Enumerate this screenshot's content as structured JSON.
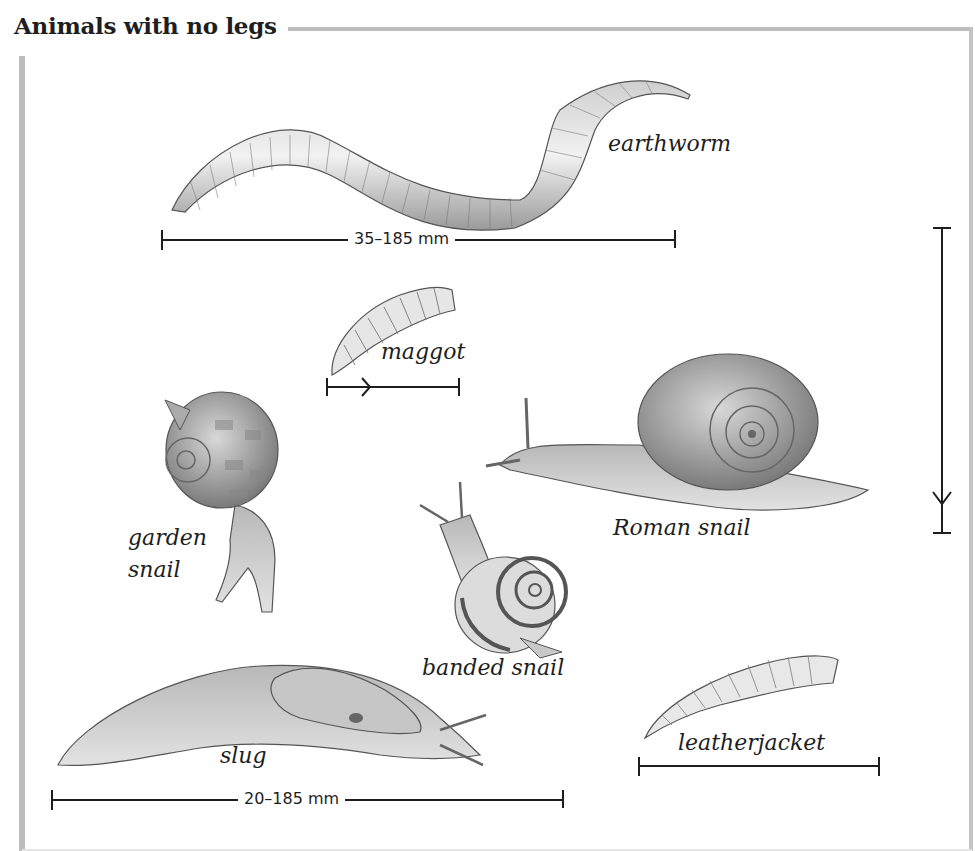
{
  "title": "Animals with no legs",
  "animals": [
    {
      "name": "earthworm",
      "label": "earthworm"
    },
    {
      "name": "maggot",
      "label": "maggot"
    },
    {
      "name": "garden-snail",
      "label_line1": "garden",
      "label_line2": "snail"
    },
    {
      "name": "roman-snail",
      "label": "Roman snail"
    },
    {
      "name": "banded-snail",
      "label": "banded snail"
    },
    {
      "name": "slug",
      "label": "slug"
    },
    {
      "name": "leatherjacket",
      "label": "leatherjacket"
    }
  ],
  "scales": {
    "earthworm_range": "35–185 mm",
    "slug_range": "20–185 mm"
  }
}
